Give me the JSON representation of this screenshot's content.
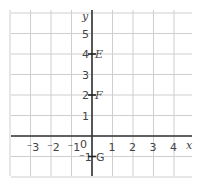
{
  "diagram": {
    "type": "coordinate-grid",
    "axes": {
      "x_label": "x",
      "y_label": "y",
      "origin_label": "0",
      "x_ticks": [
        {
          "value": -3,
          "label": "⁻3"
        },
        {
          "value": -2,
          "label": "⁻2"
        },
        {
          "value": -1,
          "label": "⁻1"
        },
        {
          "value": 1,
          "label": "1"
        },
        {
          "value": 2,
          "label": "2"
        },
        {
          "value": 3,
          "label": "3"
        },
        {
          "value": 4,
          "label": "4"
        }
      ],
      "y_ticks": [
        {
          "value": 5,
          "label": "5"
        },
        {
          "value": 4,
          "label": "4"
        },
        {
          "value": 3,
          "label": "3"
        },
        {
          "value": 2,
          "label": "2"
        },
        {
          "value": 1,
          "label": "1"
        },
        {
          "value": -1,
          "label": "⁻1"
        }
      ],
      "x_range": [
        -4,
        5
      ],
      "y_range": [
        -2,
        6
      ]
    },
    "points": [
      {
        "name": "E",
        "x": 0,
        "y": 4
      },
      {
        "name": "F",
        "x": 0,
        "y": 2
      },
      {
        "name": "G",
        "x": 0,
        "y": -1
      }
    ],
    "colors": {
      "grid": "#cfcfcf",
      "axis": "#333333",
      "text": "#444444"
    }
  }
}
